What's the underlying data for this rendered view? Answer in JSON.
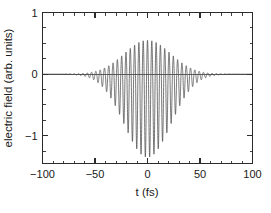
{
  "chart_data": {
    "type": "line",
    "title": "",
    "subtitle": "",
    "xlabel": "t (fs)",
    "ylabel": "electric field (arb. units)",
    "xlim": [
      -100,
      100
    ],
    "ylim": [
      -1.45,
      1.0
    ],
    "xticks": [
      -100,
      -50,
      0,
      50,
      100
    ],
    "xtick_labels": [
      "-100",
      "-50",
      "0",
      "50",
      "100"
    ],
    "yticks": [
      -1,
      0,
      1
    ],
    "ytick_labels": [
      "-1",
      "0",
      "1"
    ],
    "x_minor_tick_step": 10,
    "y_minor_tick_step": 0.25,
    "grid": false,
    "legend": null,
    "legend_position": "none",
    "annotations": [],
    "series": [
      {
        "name": "electric field",
        "color": "#4a4a4a",
        "description": "Gaussian-enveloped carrier oscillation (few-cycle laser pulse), asymmetric about zero: positive crests reach about +0.75 while negative troughs reach about -1.15 at pulse center.",
        "model": {
          "envelope": "gaussian",
          "envelope_center_fs": 0,
          "envelope_fwhm_fs": 52,
          "carrier_period_fs": 4.1,
          "carrier_phase_rad": 1.5707963,
          "positive_peak_amplitude": 0.75,
          "negative_peak_amplitude": -1.15,
          "zero_offset": -0.2
        },
        "sample_points": [
          {
            "t": -100,
            "peak_positive": 0.01,
            "peak_negative": -0.02
          },
          {
            "t": -90,
            "peak_positive": 0.02,
            "peak_negative": -0.04
          },
          {
            "t": -80,
            "peak_positive": 0.05,
            "peak_negative": -0.08
          },
          {
            "t": -70,
            "peak_positive": 0.1,
            "peak_negative": -0.16
          },
          {
            "t": -60,
            "peak_positive": 0.2,
            "peak_negative": -0.31
          },
          {
            "t": -50,
            "peak_positive": 0.33,
            "peak_negative": -0.51
          },
          {
            "t": -40,
            "peak_positive": 0.48,
            "peak_negative": -0.74
          },
          {
            "t": -30,
            "peak_positive": 0.61,
            "peak_negative": -0.94
          },
          {
            "t": -20,
            "peak_positive": 0.7,
            "peak_negative": -1.08
          },
          {
            "t": -10,
            "peak_positive": 0.745,
            "peak_negative": -1.14
          },
          {
            "t": 0,
            "peak_positive": 0.75,
            "peak_negative": -1.15
          },
          {
            "t": 10,
            "peak_positive": 0.745,
            "peak_negative": -1.14
          },
          {
            "t": 20,
            "peak_positive": 0.7,
            "peak_negative": -1.08
          },
          {
            "t": 30,
            "peak_positive": 0.61,
            "peak_negative": -0.94
          },
          {
            "t": 40,
            "peak_positive": 0.48,
            "peak_negative": -0.74
          },
          {
            "t": 50,
            "peak_positive": 0.33,
            "peak_negative": -0.51
          },
          {
            "t": 60,
            "peak_positive": 0.2,
            "peak_negative": -0.31
          },
          {
            "t": 70,
            "peak_positive": 0.1,
            "peak_negative": -0.16
          },
          {
            "t": 80,
            "peak_positive": 0.05,
            "peak_negative": -0.08
          },
          {
            "t": 90,
            "peak_positive": 0.02,
            "peak_negative": -0.04
          },
          {
            "t": 100,
            "peak_positive": 0.01,
            "peak_negative": -0.02
          }
        ]
      }
    ]
  },
  "colors": {
    "axis": "#2b2b2b",
    "curve": "#4a4a4a",
    "background": "#ffffff",
    "text": "#1a1a1a"
  }
}
